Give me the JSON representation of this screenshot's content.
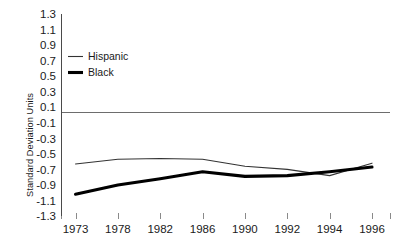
{
  "chart_data": {
    "type": "line",
    "title": "",
    "xlabel": "",
    "ylabel": "Standard Deviation Units",
    "x": [
      1973,
      1978,
      1982,
      1986,
      1990,
      1992,
      1994,
      1996
    ],
    "xtick_labels": [
      "1973",
      "1978",
      "1982",
      "1986",
      "1990",
      "1992",
      "1994",
      "1996"
    ],
    "ytick_labels": [
      "1.3",
      "1.1",
      "0.9",
      "0.7",
      "0.5",
      "0.3",
      "0.1",
      "-0.1",
      "-0.3",
      "-0.5",
      "-0.7",
      "-0.9",
      "-1.1",
      "-1.3"
    ],
    "ytick_values": [
      1.3,
      1.1,
      0.9,
      0.7,
      0.5,
      0.3,
      0.1,
      -0.1,
      -0.3,
      -0.5,
      -0.7,
      -0.9,
      -1.1,
      -1.3
    ],
    "ylim": [
      -1.3,
      1.3
    ],
    "grid": false,
    "zero_reference_line": 0.0,
    "legend_position": "upper-left-inside",
    "series": [
      {
        "name": "Hispanic",
        "style": "thin",
        "color": "#333333",
        "values": [
          -0.63,
          -0.57,
          -0.56,
          -0.57,
          -0.66,
          -0.7,
          -0.78,
          -0.62
        ]
      },
      {
        "name": "Black",
        "style": "thick",
        "color": "#000000",
        "values": [
          -1.02,
          -0.9,
          -0.82,
          -0.73,
          -0.79,
          -0.78,
          -0.73,
          -0.67
        ]
      }
    ]
  },
  "legend": {
    "items": [
      {
        "label": "Hispanic"
      },
      {
        "label": "Black"
      }
    ]
  }
}
